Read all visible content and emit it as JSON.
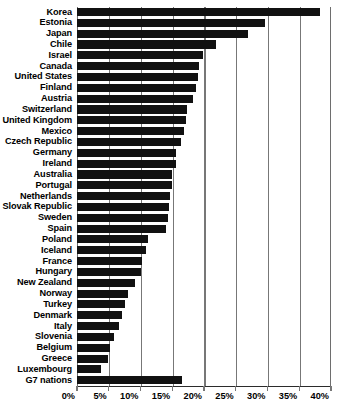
{
  "chart_data": {
    "type": "bar",
    "orientation": "horizontal",
    "title": "",
    "subtitle": "",
    "xlabel": "",
    "ylabel": "",
    "xlim": [
      0,
      40
    ],
    "xunit": "%",
    "grid": true,
    "legend": false,
    "legend_position": "none",
    "bar_color": "#111111",
    "gridline_color": "#777777",
    "axis_color": "#2b2b2b",
    "xticks": [
      0,
      5,
      10,
      15,
      20,
      25,
      30,
      35,
      40
    ],
    "xtick_labels": [
      "0%",
      "5%",
      "10%",
      "15%",
      "20%",
      "25%",
      "30%",
      "35%",
      "40%"
    ],
    "categories": [
      "Korea",
      "Estonia",
      "Japan",
      "Chile",
      "Israel",
      "Canada",
      "United States",
      "Finland",
      "Austria",
      "Switzerland",
      "United Kingdom",
      "Mexico",
      "Czech Republic",
      "Germany",
      "Ireland",
      "Australia",
      "Portugal",
      "Netherlands",
      "Slovak Republic",
      "Sweden",
      "Spain",
      "Poland",
      "Iceland",
      "France",
      "Hungary",
      "New Zealand",
      "Norway",
      "Turkey",
      "Denmark",
      "Italy",
      "Slovenia",
      "Belgium",
      "Greece",
      "Luxembourg",
      "G7 nations"
    ],
    "values": [
      38.2,
      29.6,
      26.9,
      21.9,
      19.8,
      19.2,
      19.0,
      18.7,
      18.2,
      17.3,
      17.2,
      16.9,
      16.4,
      15.6,
      15.6,
      15.0,
      14.9,
      14.6,
      14.5,
      14.3,
      14.0,
      11.2,
      10.9,
      10.2,
      10.0,
      9.1,
      8.0,
      7.6,
      7.1,
      6.6,
      5.8,
      5.2,
      4.9,
      3.8,
      16.5
    ]
  }
}
